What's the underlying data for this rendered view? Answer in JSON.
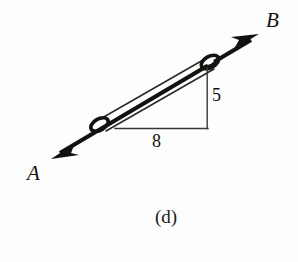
{
  "figure": {
    "caption": "(d)",
    "labels": {
      "end_a": "A",
      "end_b": "B",
      "horizontal_leg": "8",
      "vertical_leg": "5"
    },
    "colors": {
      "ink": "#14120f",
      "thin_line": "#2a2724",
      "background": "#fdfdfd"
    },
    "geometry": {
      "bar_axis_start": [
        95,
        128
      ],
      "bar_axis_end": [
        212,
        62
      ],
      "arrow_a_tip": [
        52,
        158
      ],
      "arrow_b_tip": [
        258,
        35
      ],
      "triangle_corner": [
        115,
        128
      ],
      "triangle_right_angle": [
        207,
        128
      ],
      "triangle_apex": [
        207,
        68
      ],
      "eyelet_lower": [
        99,
        124
      ],
      "eyelet_upper": [
        209,
        62
      ],
      "slope_run": 8,
      "slope_rise": 5
    }
  }
}
